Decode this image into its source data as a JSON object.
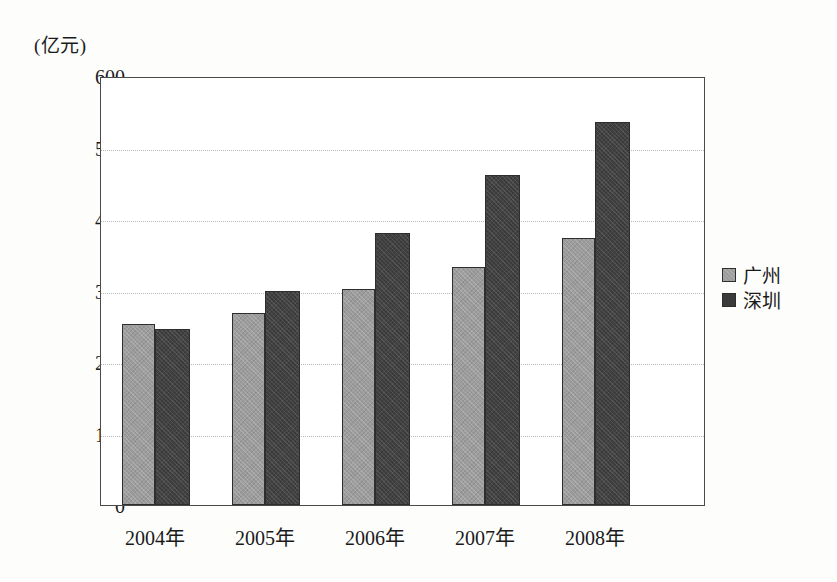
{
  "chart_data": {
    "type": "bar",
    "title": "",
    "subtitle": "",
    "xlabel": "",
    "ylabel": "(亿元)",
    "unit_caption": "(亿元)",
    "categories": [
      "2004年",
      "2005年",
      "2006年",
      "2007年",
      "2008年"
    ],
    "series": [
      {
        "name": "广州",
        "color": "#9c9c9c",
        "values": [
          253,
          268,
          302,
          333,
          374
        ]
      },
      {
        "name": "深圳",
        "color": "#3b3b3b",
        "values": [
          246,
          299,
          381,
          462,
          535
        ]
      }
    ],
    "ylim": [
      0,
      600
    ],
    "ytick_step": 100,
    "yticks": [
      "600",
      "500",
      "400",
      "300",
      "200",
      "100",
      "0"
    ],
    "grid": true,
    "legend_position": "right",
    "legend": [
      "广州",
      "深圳"
    ]
  },
  "legend": {
    "items": [
      {
        "label": "广州",
        "swatch": "legend-swatch-guangzhou"
      },
      {
        "label": "深圳",
        "swatch": "legend-swatch-shenzhen"
      }
    ]
  }
}
